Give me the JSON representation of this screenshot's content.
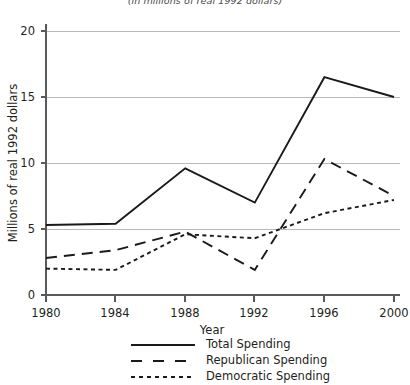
{
  "chart_data": {
    "type": "line",
    "title": "",
    "subtitle": "(in millions of real 1992 dollars)",
    "xlabel": "Year",
    "ylabel": "Millions of real 1992 dollars",
    "x": [
      1980,
      1984,
      1988,
      1992,
      1996,
      2000
    ],
    "categories": [
      "1980",
      "1984",
      "1988",
      "1992",
      "1996",
      "2000"
    ],
    "xlim": [
      1980,
      2000
    ],
    "ylim": [
      0,
      20
    ],
    "yticks": [
      0,
      5,
      10,
      15,
      20
    ],
    "ytick_labels": [
      "0",
      "5",
      "10",
      "15",
      "20"
    ],
    "xticks": [
      1980,
      1984,
      1988,
      1992,
      1996,
      2000
    ],
    "xtick_labels": [
      "1980",
      "1984",
      "1988",
      "1992",
      "1996",
      "2000"
    ],
    "grid": "horizontal",
    "legend_position": "bottom",
    "series": [
      {
        "name": "Total Spending",
        "style": "solid",
        "color": "#1a1a1a",
        "values": [
          5.3,
          5.4,
          9.6,
          7.0,
          16.5,
          15.0
        ]
      },
      {
        "name": "Republican Spending",
        "style": "long-dash",
        "color": "#1a1a1a",
        "values": [
          2.8,
          3.4,
          4.8,
          1.9,
          10.3,
          7.5
        ]
      },
      {
        "name": "Democratic Spending",
        "style": "short-dash",
        "color": "#1a1a1a",
        "values": [
          2.0,
          1.9,
          4.6,
          4.3,
          6.2,
          7.2
        ]
      }
    ]
  },
  "legend": {
    "items": [
      {
        "label": "Total Spending",
        "style": "solid"
      },
      {
        "label": "Republican Spending",
        "style": "long-dash"
      },
      {
        "label": "Democratic Spending",
        "style": "short-dash"
      }
    ]
  }
}
